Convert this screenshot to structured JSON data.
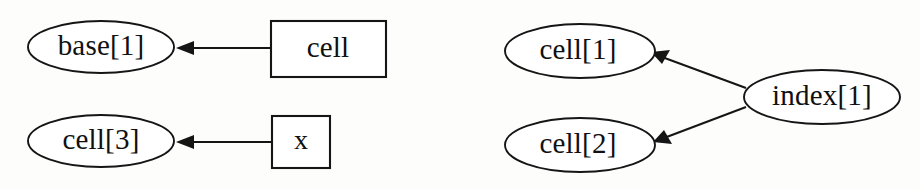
{
  "figure": {
    "kind": "points-to-graph",
    "background_color": "#fdfdfc",
    "ink_color": "#151515",
    "node_fill": "#ffffff"
  },
  "groups": [
    {
      "name": "left-group",
      "nodes": [
        {
          "id": "base1",
          "label": "base[1]",
          "shape": "ellipse",
          "cx": 101,
          "cy": 47,
          "rx": 73,
          "ry": 26
        },
        {
          "id": "cell",
          "label": "cell",
          "shape": "rectangle",
          "x": 271,
          "y": 21,
          "w": 115,
          "h": 56
        },
        {
          "id": "cell3",
          "label": "cell[3]",
          "shape": "ellipse",
          "cx": 101,
          "cy": 141,
          "rx": 73,
          "ry": 26
        },
        {
          "id": "x",
          "label": "x",
          "shape": "rectangle",
          "x": 272,
          "y": 116,
          "w": 58,
          "h": 52
        }
      ],
      "edges": [
        {
          "id": "cell-to-base1",
          "from": "cell",
          "to": "base1",
          "x1": 271,
          "y1": 48,
          "x2": 176,
          "y2": 48
        },
        {
          "id": "x-to-cell3",
          "from": "x",
          "to": "cell3",
          "x1": 272,
          "y1": 142,
          "x2": 176,
          "y2": 142
        }
      ]
    },
    {
      "name": "right-group",
      "nodes": [
        {
          "id": "cell1",
          "label": "cell[1]",
          "shape": "ellipse",
          "cx": 580,
          "cy": 51,
          "rx": 75,
          "ry": 27
        },
        {
          "id": "cell2",
          "label": "cell[2]",
          "shape": "ellipse",
          "cx": 580,
          "cy": 145,
          "rx": 75,
          "ry": 27
        },
        {
          "id": "index1",
          "label": "index[1]",
          "shape": "ellipse",
          "cx": 822,
          "cy": 97,
          "rx": 78,
          "ry": 27
        }
      ],
      "edges": [
        {
          "id": "index1-to-cell1",
          "from": "index[1]",
          "to": "cell[1]",
          "x1": 746,
          "y1": 88,
          "x2": 652,
          "y2": 53
        },
        {
          "id": "index1-to-cell2",
          "from": "index[1]",
          "to": "cell[2]",
          "x1": 746,
          "y1": 107,
          "x2": 654,
          "y2": 142
        }
      ]
    }
  ],
  "labels": {
    "base1": "base[1]",
    "cell": "cell",
    "cell3": "cell[3]",
    "x": "x",
    "cell1": "cell[1]",
    "cell2": "cell[2]",
    "index1": "index[1]"
  }
}
